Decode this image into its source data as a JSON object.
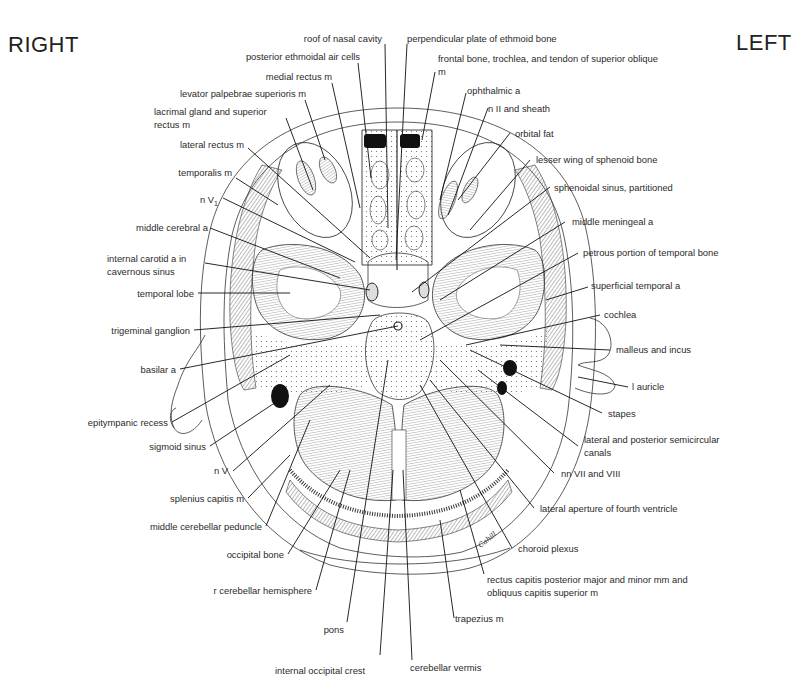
{
  "orientation": {
    "right": "RIGHT",
    "left": "LEFT"
  },
  "signature": "Cahill",
  "labels_left": [
    {
      "id": "roof-of-nasal-cavity",
      "text": "roof of nasal cavity"
    },
    {
      "id": "posterior-ethmoidal-air-cells",
      "text": "posterior ethmoidal air cells"
    },
    {
      "id": "medial-rectus",
      "text": "medial rectus m"
    },
    {
      "id": "levator-palpebrae",
      "text": "levator palpebrae superioris m"
    },
    {
      "id": "lacrimal-gland",
      "text": "lacrimal gland and superior rectus m"
    },
    {
      "id": "lateral-rectus",
      "text": "lateral rectus m"
    },
    {
      "id": "temporalis",
      "text": "temporalis m"
    },
    {
      "id": "n-v1",
      "text": "n V",
      "sub": "1"
    },
    {
      "id": "middle-cerebral-a",
      "text": "middle cerebral a"
    },
    {
      "id": "internal-carotid",
      "text": "internal carotid a in cavernous sinus"
    },
    {
      "id": "temporal-lobe",
      "text": "temporal lobe"
    },
    {
      "id": "trigeminal-ganglion",
      "text": "trigeminal ganglion"
    },
    {
      "id": "basilar-a",
      "text": "basilar a"
    },
    {
      "id": "epitympanic-recess",
      "text": "epitympanic recess"
    },
    {
      "id": "sigmoid-sinus",
      "text": "sigmoid sinus"
    },
    {
      "id": "n-v",
      "text": "n V"
    },
    {
      "id": "splenius-capitis",
      "text": "splenius capitis m"
    },
    {
      "id": "middle-cerebellar-peduncle",
      "text": "middle cerebellar peduncle"
    },
    {
      "id": "occipital-bone",
      "text": "occipital bone"
    },
    {
      "id": "r-cerebellar-hemisphere",
      "text": "r cerebellar hemisphere"
    },
    {
      "id": "pons",
      "text": "pons"
    },
    {
      "id": "internal-occipital-crest",
      "text": "internal occipital crest"
    }
  ],
  "labels_right": [
    {
      "id": "perpendicular-plate",
      "text": "perpendicular plate of ethmoid bone"
    },
    {
      "id": "frontal-bone-trochlea",
      "text": "frontal bone, trochlea, and tendon of superior oblique m"
    },
    {
      "id": "ophthalmic-a",
      "text": "ophthalmic a"
    },
    {
      "id": "n-ii-sheath",
      "text": "n II and sheath"
    },
    {
      "id": "orbital-fat",
      "text": "orbital fat"
    },
    {
      "id": "lesser-wing-sphenoid",
      "text": "lesser wing of sphenoid bone"
    },
    {
      "id": "sphenoidal-sinus",
      "text": "sphenoidal sinus, partitioned"
    },
    {
      "id": "middle-meningeal-a",
      "text": "middle meningeal a"
    },
    {
      "id": "petrous-temporal",
      "text": "petrous portion of temporal bone"
    },
    {
      "id": "superficial-temporal-a",
      "text": "superficial temporal a"
    },
    {
      "id": "cochlea",
      "text": "cochlea"
    },
    {
      "id": "malleus-incus",
      "text": "malleus and incus"
    },
    {
      "id": "l-auricle",
      "text": "l auricle"
    },
    {
      "id": "stapes",
      "text": "stapes"
    },
    {
      "id": "semicircular-canals",
      "text": "lateral and posterior semicircular canals"
    },
    {
      "id": "nn-vii-viii",
      "text": "nn VII and VIII"
    },
    {
      "id": "lateral-aperture",
      "text": "lateral aperture of fourth ventricle"
    },
    {
      "id": "choroid-plexus",
      "text": "choroid plexus"
    },
    {
      "id": "rectus-capitis",
      "text": "rectus capitis posterior major and minor mm and obliquus capitis superior m"
    },
    {
      "id": "trapezius",
      "text": "trapezius m"
    },
    {
      "id": "cerebellar-vermis",
      "text": "cerebellar vermis"
    }
  ]
}
